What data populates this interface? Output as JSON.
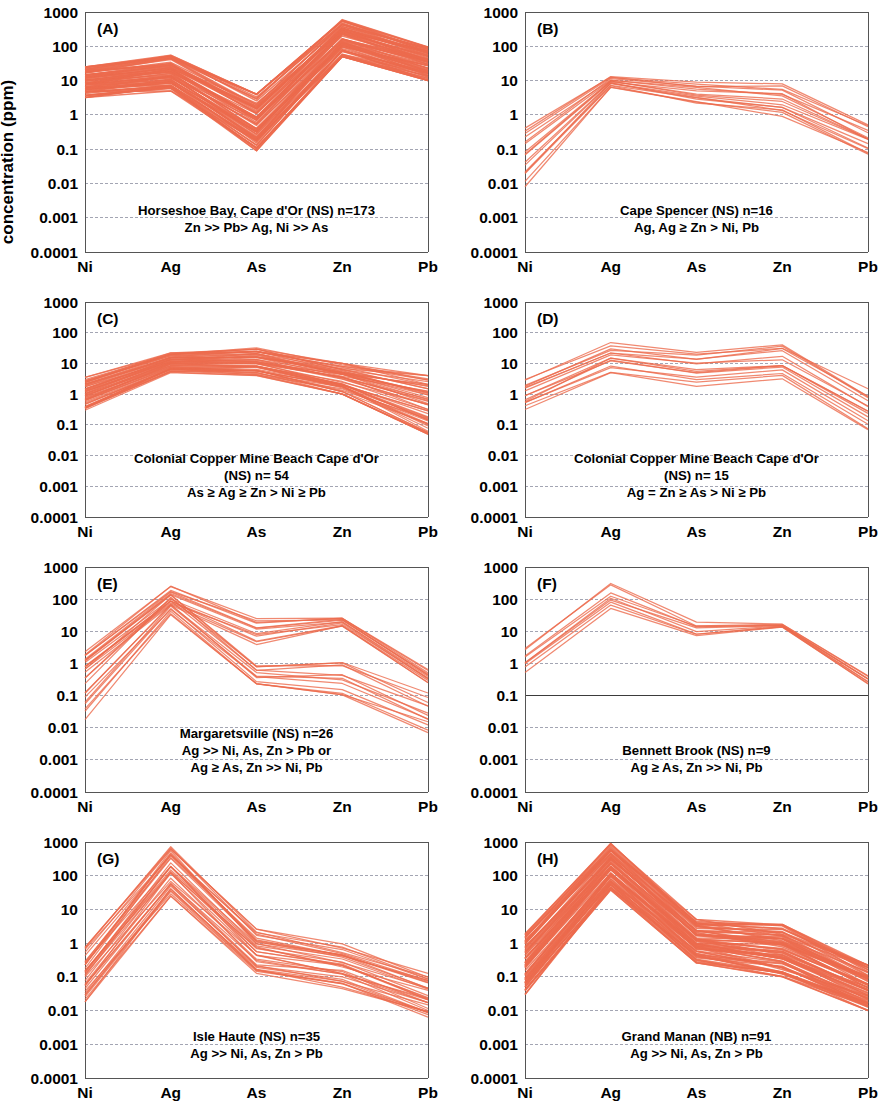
{
  "figure": {
    "y_axis_label": "concentration (ppm)",
    "categories": [
      "Ni",
      "Ag",
      "As",
      "Zn",
      "Pb"
    ],
    "y_ticks": [
      "1000",
      "100",
      "10",
      "1",
      "0.1",
      "0.01",
      "0.001",
      "0.0001"
    ],
    "line_color": "#EC6B4E",
    "grid_color": "#8c8fa0",
    "axis_color": "#555555"
  },
  "chart_data": [
    {
      "type": "line",
      "panel": "(A)",
      "title": "Horseshoe Bay, Cape d'Or (NS) n=173",
      "caption_lines": [
        "Horseshoe Bay, Cape d'Or (NS) n=173",
        "Zn >> Pb> Ag, Ni >> As"
      ],
      "n": 173,
      "xlabel": "",
      "ylabel": "concentration (ppm)",
      "categories": [
        "Ni",
        "Ag",
        "As",
        "Zn",
        "Pb"
      ],
      "ylim": [
        0.0001,
        1000
      ],
      "grid": true,
      "envelope": {
        "upper": [
          25,
          55,
          4.0,
          600,
          100
        ],
        "lower": [
          3.2,
          5.0,
          0.09,
          50,
          10
        ]
      },
      "series_count": 173
    },
    {
      "type": "line",
      "panel": "(B)",
      "title": "Cape Spencer (NS) n=16",
      "caption_lines": [
        "Cape Spencer (NS) n=16",
        "Ag, Ag ≥ Zn > Ni, Pb"
      ],
      "n": 16,
      "categories": [
        "Ni",
        "Ag",
        "As",
        "Zn",
        "Pb"
      ],
      "ylim": [
        0.0001,
        1000
      ],
      "grid": true,
      "envelope": {
        "upper": [
          0.55,
          14,
          9.0,
          8.0,
          0.55
        ],
        "lower": [
          0.008,
          6.0,
          2.0,
          0.9,
          0.065
        ]
      },
      "series_count": 16
    },
    {
      "type": "line",
      "panel": "(C)",
      "title": "Colonial Copper Mine Beach Cape d'Or (NS) n= 54",
      "caption_lines": [
        "Colonial Copper Mine Beach Cape d'Or",
        "(NS) n= 54",
        "As ≥ Ag ≥ Zn > Ni ≥ Pb"
      ],
      "n": 54,
      "categories": [
        "Ni",
        "Ag",
        "As",
        "Zn",
        "Pb"
      ],
      "ylim": [
        0.0001,
        1000
      ],
      "grid": true,
      "envelope": {
        "upper": [
          3.5,
          22,
          32,
          10,
          4.0
        ],
        "lower": [
          0.3,
          5.0,
          4.0,
          1.0,
          0.05
        ]
      },
      "series_count": 54
    },
    {
      "type": "line",
      "panel": "(D)",
      "title": "Colonial Copper Mine Beach Cape d'Or (NS) n= 15",
      "caption_lines": [
        "Colonial Copper Mine Beach Cape d'Or",
        "(NS) n= 15",
        "Ag = Zn ≥ As > Ni ≥ Pb"
      ],
      "n": 15,
      "categories": [
        "Ni",
        "Ag",
        "As",
        "Zn",
        "Pb"
      ],
      "ylim": [
        0.0001,
        1000
      ],
      "grid": true,
      "envelope": {
        "upper": [
          3.0,
          50,
          25,
          45,
          1.5
        ],
        "lower": [
          0.3,
          5.0,
          1.8,
          2.8,
          0.07
        ]
      },
      "series_count": 15
    },
    {
      "type": "line",
      "panel": "(E)",
      "title": "Margaretsville (NS) n=26",
      "caption_lines": [
        "Margaretsville (NS) n=26",
        "Ag >> Ni, As, Zn > Pb or",
        "Ag ≥ As, Zn >> Ni, Pb"
      ],
      "n": 26,
      "categories": [
        "Ni",
        "Ag",
        "As",
        "Zn",
        "Pb"
      ],
      "ylim": [
        0.0001,
        1000
      ],
      "grid": true,
      "envelope": {
        "upper": [
          2.3,
          280,
          30,
          28,
          0.65
        ],
        "lower": [
          0.015,
          30,
          0.2,
          0.07,
          0.007
        ]
      },
      "subgroups": [
        {
          "name": "high-As branch",
          "upper": [
            2.3,
            280,
            30,
            28,
            0.65
          ],
          "lower": [
            0.5,
            60,
            3.5,
            14,
            0.25
          ]
        },
        {
          "name": "low-As branch",
          "upper": [
            1.2,
            150,
            0.9,
            1.5,
            0.12
          ],
          "lower": [
            0.015,
            30,
            0.2,
            0.07,
            0.007
          ]
        }
      ],
      "series_count": 26
    },
    {
      "type": "line",
      "panel": "(F)",
      "title": "Bennett Brook (NS) n=9",
      "caption_lines": [
        "Bennett Brook (NS) n=9",
        "Ag ≥ As, Zn >> Ni, Pb"
      ],
      "n": 9,
      "categories": [
        "Ni",
        "Ag",
        "As",
        "Zn",
        "Pb"
      ],
      "ylim": [
        0.0001,
        1000
      ],
      "grid": true,
      "emphasized_gridline": "0.1",
      "envelope": {
        "upper": [
          3.5,
          350,
          20,
          17,
          0.42
        ],
        "lower": [
          0.45,
          38,
          6.5,
          13,
          0.22
        ]
      },
      "series_count": 9
    },
    {
      "type": "line",
      "panel": "(G)",
      "title": "Isle Haute (NS) n=35",
      "caption_lines": [
        "Isle Haute (NS) n=35",
        "Ag >> Ni, As, Zn > Pb"
      ],
      "n": 35,
      "categories": [
        "Ni",
        "Ag",
        "As",
        "Zn",
        "Pb"
      ],
      "ylim": [
        0.0001,
        1000
      ],
      "grid": true,
      "envelope": {
        "upper": [
          0.75,
          900,
          2.6,
          0.95,
          0.13
        ],
        "lower": [
          0.018,
          25,
          0.1,
          0.045,
          0.006
        ]
      },
      "series_count": 35
    },
    {
      "type": "line",
      "panel": "(H)",
      "title": "Grand Manan (NB) n=91",
      "caption_lines": [
        "Grand Manan (NB) n=91",
        "Ag >> Ni, As, Zn > Pb"
      ],
      "n": 91,
      "categories": [
        "Ni",
        "Ag",
        "As",
        "Zn",
        "Pb"
      ],
      "ylim": [
        0.0001,
        1000
      ],
      "grid": true,
      "envelope": {
        "upper": [
          1.9,
          900,
          5.0,
          3.6,
          0.22
        ],
        "lower": [
          0.03,
          38,
          0.26,
          0.1,
          0.01
        ]
      },
      "series_count": 91
    }
  ]
}
